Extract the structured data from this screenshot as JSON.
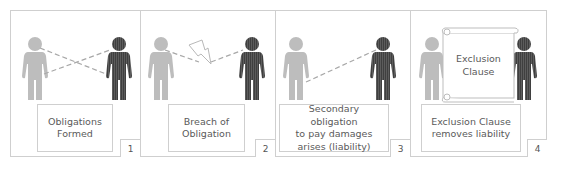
{
  "diagram": {
    "panels": [
      {
        "number": "1",
        "caption_line1": "Obligations",
        "caption_line2": "Formed",
        "caption_line3": "",
        "connector": "crossed-dashed-lines"
      },
      {
        "number": "2",
        "caption_line1": "Breach of",
        "caption_line2": "Obligation",
        "caption_line3": "",
        "connector": "broken-dashed-line-with-lightning"
      },
      {
        "number": "3",
        "caption_line1": "Secondary obligation",
        "caption_line2": "to pay damages",
        "caption_line3": "arises (liability)",
        "connector": "single-dashed-line"
      },
      {
        "number": "4",
        "caption_line1": "Exclusion Clause",
        "caption_line2": "removes liability",
        "caption_line3": "",
        "connector": "scroll"
      }
    ],
    "scroll": {
      "line1": "Exclusion",
      "line2": "Clause"
    },
    "colors": {
      "person_light": "#bdbdbd",
      "person_dark": "#4a4a4a",
      "border": "#cfcfcf",
      "dash": "#a8a8a8",
      "text": "#5a5a5a"
    }
  }
}
